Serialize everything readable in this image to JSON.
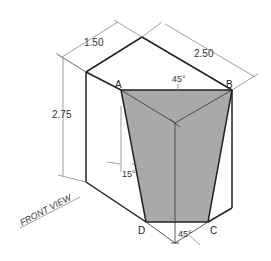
{
  "figure": {
    "type": "isometric-drawing",
    "colors": {
      "background": "#ffffff",
      "outline": "#222222",
      "face_fill": "#a9a9a9",
      "dimension_line": "#666666"
    },
    "dimensions": {
      "depth": "1.50",
      "width": "2.50",
      "height": "2.75"
    },
    "vertex_labels": {
      "a": "A",
      "b": "B",
      "c": "C",
      "d": "D"
    },
    "angles": {
      "top": "45°",
      "side": "15°",
      "bottom": "45°"
    },
    "view_label": "FRONT VIEW"
  }
}
